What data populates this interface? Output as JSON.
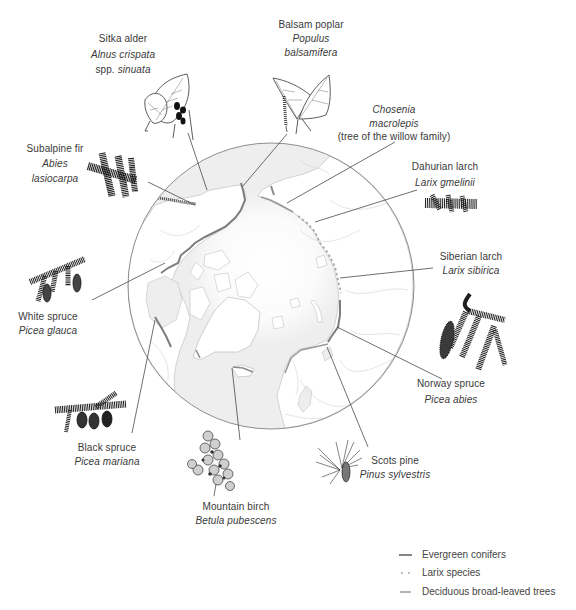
{
  "species": {
    "sitka_alder": {
      "common_name": "Sitka alder",
      "scientific_name": "Alnus crispata",
      "subspecies_rank": "spp.",
      "subspecies": "sinuata"
    },
    "balsam_poplar": {
      "common_name": "Balsam poplar",
      "genus": "Populus",
      "epithet": "balsamifera"
    },
    "subalpine_fir": {
      "common_name": "Subalpine fir",
      "genus": "Abies",
      "epithet": "lasiocarpa"
    },
    "chosenia": {
      "genus": "Chosenia",
      "epithet": "macrolepis",
      "note": "(tree of the willow family)"
    },
    "dahurian_larch": {
      "common_name": "Dahurian larch",
      "scientific_name": "Larix gmelinii"
    },
    "siberian_larch": {
      "common_name": "Siberian larch",
      "scientific_name": "Larix sibirica"
    },
    "white_spruce": {
      "common_name": "White spruce",
      "scientific_name": "Picea glauca"
    },
    "norway_spruce": {
      "common_name": "Norway spruce",
      "scientific_name": "Picea abies"
    },
    "black_spruce": {
      "common_name": "Black spruce",
      "scientific_name": "Picea mariana"
    },
    "scots_pine": {
      "common_name": "Scots pine",
      "scientific_name": "Pinus sylvestris"
    },
    "mountain_birch": {
      "common_name": "Mountain birch",
      "scientific_name": "Betula pubescens"
    }
  },
  "legend": {
    "items": [
      {
        "label": "Evergreen conifers",
        "style": "solid",
        "color": "#858585"
      },
      {
        "label": "Larix species",
        "style": "dotted",
        "color": "#a8a8a8"
      },
      {
        "label": "Deciduous broad-leaved trees",
        "style": "solid",
        "color": "#b4b4b4"
      }
    ]
  },
  "colors": {
    "ocean": "#eeeeee",
    "land": "#ffffff",
    "coast": "#c2c2c2",
    "globe_outline": "#8e8e8e",
    "leader_line": "#4a4a4a",
    "text": "#3a3a3a"
  }
}
